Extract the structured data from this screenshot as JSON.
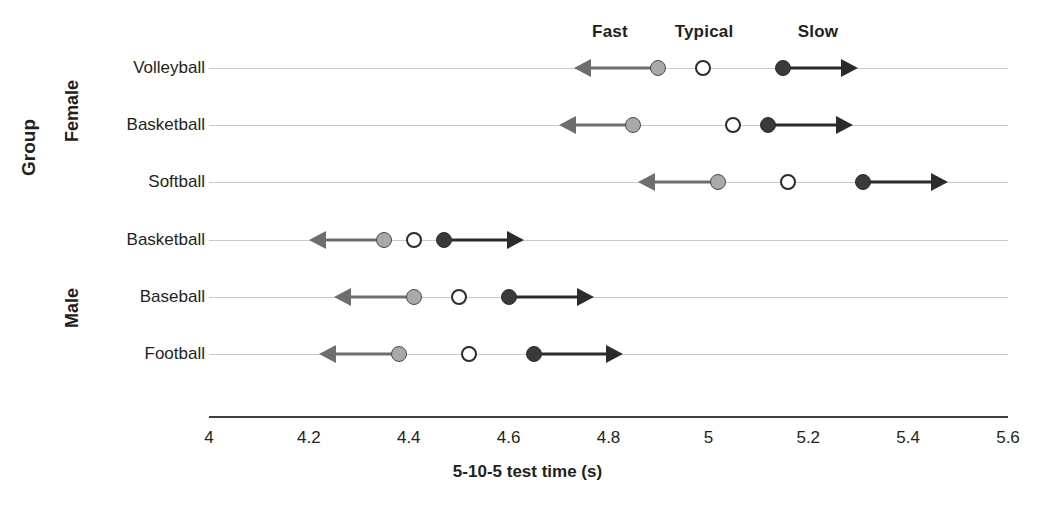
{
  "chart_data": {
    "type": "scatter",
    "title": "",
    "xlabel": "5-10-5 test time (s)",
    "ylabel": "Group",
    "xlim": [
      4,
      5.6
    ],
    "xticks": [
      "4",
      "4.2",
      "4.4",
      "4.6",
      "4.8",
      "5",
      "5.2",
      "5.4",
      "5.6"
    ],
    "xtick_values": [
      4,
      4.2,
      4.4,
      4.6,
      4.8,
      5,
      5.2,
      5.4,
      5.6
    ],
    "grid": true,
    "legend_position": "top",
    "legend": [
      {
        "name": "Fast",
        "marker": "filled-gray-circle-with-left-arrow",
        "color": "#a9a9a9"
      },
      {
        "name": "Typical",
        "marker": "hollow-circle",
        "color": "#ffffff"
      },
      {
        "name": "Slow",
        "marker": "filled-dark-circle-with-right-arrow",
        "color": "#3a3a3a"
      }
    ],
    "series": [
      {
        "name": "Fast",
        "values": [
          4.9,
          4.85,
          5.02,
          4.35,
          4.41,
          4.38
        ]
      },
      {
        "name": "Typical",
        "values": [
          4.99,
          5.05,
          5.16,
          4.41,
          4.5,
          4.52
        ]
      },
      {
        "name": "Slow",
        "values": [
          5.15,
          5.12,
          5.31,
          4.47,
          4.6,
          4.65
        ]
      }
    ],
    "categories": [
      "Volleyball",
      "Basketball",
      "Softball",
      "Basketball",
      "Baseball",
      "Football"
    ],
    "group_bands": [
      {
        "label": "Female",
        "categories": [
          "Volleyball",
          "Basketball",
          "Softball"
        ]
      },
      {
        "label": "Male",
        "categories": [
          "Basketball",
          "Baseball",
          "Football"
        ]
      }
    ],
    "rows": [
      {
        "category": "Volleyball",
        "group": "Female",
        "fast": 4.9,
        "typical": 4.99,
        "slow": 5.15,
        "fast_arrow_to": 4.73,
        "slow_arrow_to": 5.3
      },
      {
        "category": "Basketball",
        "group": "Female",
        "fast": 4.85,
        "typical": 5.05,
        "slow": 5.12,
        "fast_arrow_to": 4.7,
        "slow_arrow_to": 5.29
      },
      {
        "category": "Softball",
        "group": "Female",
        "fast": 5.02,
        "typical": 5.16,
        "slow": 5.31,
        "fast_arrow_to": 4.86,
        "slow_arrow_to": 5.48
      },
      {
        "category": "Basketball",
        "group": "Male",
        "fast": 4.35,
        "typical": 4.41,
        "slow": 4.47,
        "fast_arrow_to": 4.2,
        "slow_arrow_to": 4.63
      },
      {
        "category": "Baseball",
        "group": "Male",
        "fast": 4.41,
        "typical": 4.5,
        "slow": 4.6,
        "fast_arrow_to": 4.25,
        "slow_arrow_to": 4.77
      },
      {
        "category": "Football",
        "group": "Male",
        "fast": 4.38,
        "typical": 4.52,
        "slow": 4.65,
        "fast_arrow_to": 4.22,
        "slow_arrow_to": 4.83
      }
    ]
  },
  "colors": {
    "fast": "#a9a9a9",
    "typical": "#ffffff",
    "slow": "#3a3a3a",
    "gridline": "#c9c9c9",
    "axis": "#3f3f3f",
    "text": "#231f20"
  }
}
